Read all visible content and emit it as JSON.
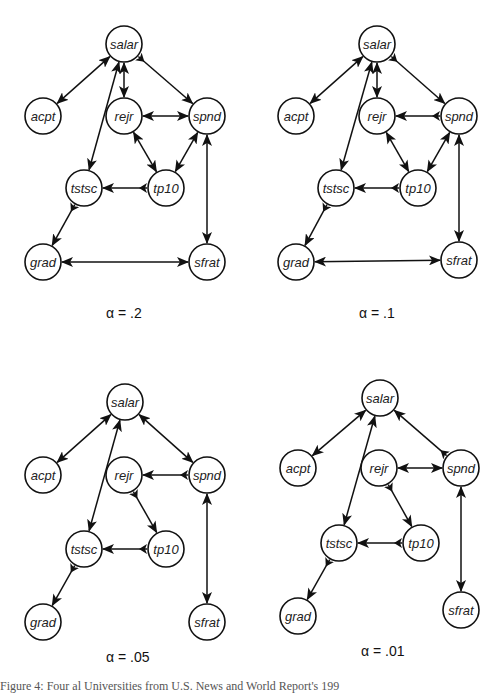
{
  "figure": {
    "caption": "Figure 4:  Four al Universities from U.S. News and World Report's 199",
    "node_radius": 18,
    "node_names": [
      "salar",
      "acpt",
      "rejr",
      "spnd",
      "tstsc",
      "tp10",
      "grad",
      "sfrat"
    ],
    "panels": [
      {
        "alpha_label": "α = .2",
        "label_pos": [
          106,
          318
        ],
        "nodes": {
          "salar": [
            124,
            44
          ],
          "acpt": [
            43,
            116
          ],
          "rejr": [
            124,
            116
          ],
          "spnd": [
            207,
            116
          ],
          "tstsc": [
            84,
            188
          ],
          "tp10": [
            166,
            188
          ],
          "grad": [
            43,
            262
          ],
          "sfrat": [
            207,
            262
          ]
        },
        "edges": [
          {
            "from": "salar",
            "to": "acpt",
            "type": "bidirected"
          },
          {
            "from": "salar",
            "to": "tstsc",
            "type": "bidirected"
          },
          {
            "from": "salar",
            "to": "rejr",
            "type": "bidirected"
          },
          {
            "from": "salar",
            "to": "spnd",
            "type": "directed"
          },
          {
            "from": "rejr",
            "to": "spnd",
            "type": "bidirected"
          },
          {
            "from": "rejr",
            "to": "tp10",
            "type": "bidirected"
          },
          {
            "from": "spnd",
            "to": "tp10",
            "type": "bidirected"
          },
          {
            "from": "spnd",
            "to": "sfrat",
            "type": "bidirected"
          },
          {
            "from": "tp10",
            "to": "tstsc",
            "type": "directed"
          },
          {
            "from": "tstsc",
            "to": "grad",
            "type": "directed"
          },
          {
            "from": "grad",
            "to": "sfrat",
            "type": "bidirected"
          }
        ]
      },
      {
        "alpha_label": "α = .1",
        "label_pos": [
          359,
          318
        ],
        "nodes": {
          "salar": [
            377,
            44
          ],
          "acpt": [
            296,
            116
          ],
          "rejr": [
            377,
            116
          ],
          "spnd": [
            459,
            116
          ],
          "tstsc": [
            336,
            188
          ],
          "tp10": [
            418,
            188
          ],
          "grad": [
            296,
            262
          ],
          "sfrat": [
            459,
            260
          ]
        },
        "edges": [
          {
            "from": "salar",
            "to": "acpt",
            "type": "bidirected"
          },
          {
            "from": "salar",
            "to": "tstsc",
            "type": "bidirected"
          },
          {
            "from": "salar",
            "to": "rejr",
            "type": "bidirected"
          },
          {
            "from": "salar",
            "to": "spnd",
            "type": "directed"
          },
          {
            "from": "spnd",
            "to": "rejr",
            "type": "directed"
          },
          {
            "from": "rejr",
            "to": "tp10",
            "type": "bidirected"
          },
          {
            "from": "spnd",
            "to": "tp10",
            "type": "bidirected"
          },
          {
            "from": "spnd",
            "to": "sfrat",
            "type": "bidirected"
          },
          {
            "from": "tp10",
            "to": "tstsc",
            "type": "directed"
          },
          {
            "from": "tstsc",
            "to": "grad",
            "type": "directed"
          },
          {
            "from": "grad",
            "to": "sfrat",
            "type": "bidirected"
          }
        ]
      },
      {
        "alpha_label": "α = .05",
        "label_pos": [
          106,
          662
        ],
        "nodes": {
          "salar": [
            125,
            402
          ],
          "acpt": [
            43,
            475
          ],
          "rejr": [
            124,
            475
          ],
          "spnd": [
            207,
            475
          ],
          "tstsc": [
            84,
            549
          ],
          "tp10": [
            166,
            549
          ],
          "grad": [
            43,
            622
          ],
          "sfrat": [
            207,
            622
          ]
        },
        "edges": [
          {
            "from": "salar",
            "to": "acpt",
            "type": "bidirected"
          },
          {
            "from": "salar",
            "to": "tstsc",
            "type": "bidirected"
          },
          {
            "from": "salar",
            "to": "spnd",
            "type": "bidirected"
          },
          {
            "from": "spnd",
            "to": "rejr",
            "type": "directed"
          },
          {
            "from": "rejr",
            "to": "tp10",
            "type": "directed"
          },
          {
            "from": "spnd",
            "to": "sfrat",
            "type": "bidirected"
          },
          {
            "from": "tp10",
            "to": "tstsc",
            "type": "directed"
          },
          {
            "from": "tstsc",
            "to": "grad",
            "type": "directed"
          }
        ]
      },
      {
        "alpha_label": "α = .01",
        "label_pos": [
          361,
          656
        ],
        "nodes": {
          "salar": [
            380,
            398
          ],
          "acpt": [
            298,
            468
          ],
          "rejr": [
            379,
            468
          ],
          "spnd": [
            461,
            468
          ],
          "tstsc": [
            339,
            543
          ],
          "tp10": [
            421,
            543
          ],
          "grad": [
            298,
            616
          ],
          "sfrat": [
            461,
            610
          ]
        },
        "edges": [
          {
            "from": "salar",
            "to": "acpt",
            "type": "bidirected"
          },
          {
            "from": "salar",
            "to": "tstsc",
            "type": "bidirected"
          },
          {
            "from": "spnd",
            "to": "salar",
            "type": "directed"
          },
          {
            "from": "rejr",
            "to": "spnd",
            "type": "bidirected"
          },
          {
            "from": "rejr",
            "to": "tp10",
            "type": "directed"
          },
          {
            "from": "spnd",
            "to": "sfrat",
            "type": "bidirected"
          },
          {
            "from": "tp10",
            "to": "tstsc",
            "type": "directed"
          },
          {
            "from": "tstsc",
            "to": "grad",
            "type": "directed"
          }
        ]
      }
    ]
  }
}
